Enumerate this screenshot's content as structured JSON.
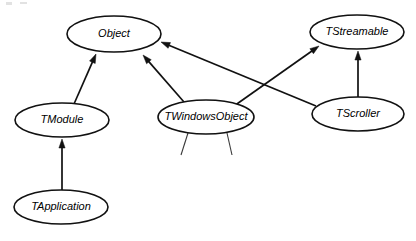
{
  "diagram": {
    "type": "class-inheritance-hierarchy",
    "canvas": {
      "width": 416,
      "height": 241
    },
    "style": {
      "background_color": "#ffffff",
      "stroke_color": "#111111",
      "node_fill_color": "#ffffff",
      "text_color": "#000000",
      "text_style": "italic",
      "node_shape": "ellipse",
      "arrow_direction": "child-points-to-parent"
    },
    "nodes": [
      {
        "id": "object",
        "label": "Object",
        "cx": 114,
        "cy": 34,
        "rx": 47,
        "ry": 18
      },
      {
        "id": "tstreamable",
        "label": "TStreamable",
        "cx": 357,
        "cy": 32,
        "rx": 47,
        "ry": 17
      },
      {
        "id": "tmodule",
        "label": "TModule",
        "cx": 62,
        "cy": 120,
        "rx": 47,
        "ry": 17
      },
      {
        "id": "twindowsobject",
        "label": "TWindowsObject",
        "cx": 206,
        "cy": 117,
        "rx": 48,
        "ry": 17
      },
      {
        "id": "tscroller",
        "label": "TScroller",
        "cx": 358,
        "cy": 114,
        "rx": 46,
        "ry": 17
      },
      {
        "id": "tapplication",
        "label": "TApplication",
        "cx": 61,
        "cy": 207,
        "rx": 47,
        "ry": 17
      }
    ],
    "edges": [
      {
        "id": "edge-tmodule-object",
        "from": "tmodule",
        "to": "object",
        "relation": "inherits",
        "arrow": true,
        "x1": 74,
        "y1": 104,
        "x2": 96,
        "y2": 54
      },
      {
        "id": "edge-twindowsobject-object",
        "from": "twindowsobject",
        "to": "object",
        "relation": "inherits",
        "arrow": true,
        "x1": 184,
        "y1": 102,
        "x2": 143,
        "y2": 55
      },
      {
        "id": "edge-tscroller-object",
        "from": "tscroller",
        "to": "object",
        "relation": "inherits",
        "arrow": true,
        "x1": 316,
        "y1": 106,
        "x2": 161,
        "y2": 42
      },
      {
        "id": "edge-twindowsobject-tstreamable",
        "from": "twindowsobject",
        "to": "tstreamable",
        "relation": "inherits",
        "arrow": true,
        "x1": 234,
        "y1": 106,
        "x2": 319,
        "y2": 46
      },
      {
        "id": "edge-tscroller-tstreamable",
        "from": "tscroller",
        "to": "tstreamable",
        "relation": "inherits",
        "arrow": true,
        "x1": 358,
        "y1": 97,
        "x2": 358,
        "y2": 51
      },
      {
        "id": "edge-tapplication-tmodule",
        "from": "tapplication",
        "to": "tmodule",
        "relation": "inherits",
        "arrow": true,
        "x1": 62,
        "y1": 190,
        "x2": 62,
        "y2": 139
      }
    ],
    "stubs": [
      {
        "id": "stub-twindowsobject-left",
        "parent": "twindowsobject",
        "x1": 188,
        "y1": 133,
        "x2": 181,
        "y2": 155
      },
      {
        "id": "stub-twindowsobject-right",
        "parent": "twindowsobject",
        "x1": 227,
        "y1": 133,
        "x2": 232,
        "y2": 155
      }
    ]
  }
}
